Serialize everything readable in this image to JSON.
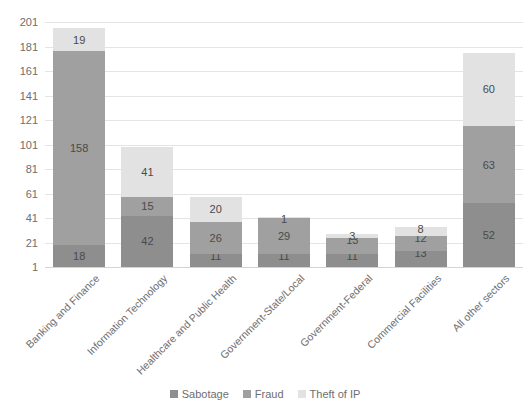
{
  "chart_data": {
    "type": "bar",
    "subtype": "stacked-bar",
    "title": "",
    "subtitle": "",
    "xlabel": "",
    "ylabel": "",
    "grid": true,
    "legend_position": "bottom",
    "ylim": [
      1,
      201
    ],
    "yticks": [
      1,
      21,
      41,
      61,
      81,
      101,
      121,
      141,
      161,
      181,
      201
    ],
    "categories": [
      "Banking and Finance",
      "Information Technology",
      "Healthcare and Public Health",
      "Government-State/Local",
      "Government-Federal",
      "Commercial Facilities",
      "All other sectors"
    ],
    "series": [
      {
        "name": "Sabotage",
        "color": "#8e8e8e",
        "values": [
          18,
          42,
          11,
          11,
          11,
          13,
          52
        ]
      },
      {
        "name": "Fraud",
        "color": "#a0a0a0",
        "values": [
          158,
          15,
          26,
          29,
          13,
          12,
          63
        ]
      },
      {
        "name": "Theft of IP",
        "color": "#e2e2e2",
        "values": [
          19,
          41,
          20,
          1,
          3,
          8,
          60
        ]
      }
    ],
    "totals": [
      195,
      98,
      57,
      41,
      27,
      33,
      175
    ]
  },
  "legend": {
    "items": [
      {
        "label": "Sabotage",
        "color": "#8e8e8e"
      },
      {
        "label": "Fraud",
        "color": "#a0a0a0"
      },
      {
        "label": "Theft of IP",
        "color": "#e2e2e2"
      }
    ]
  }
}
